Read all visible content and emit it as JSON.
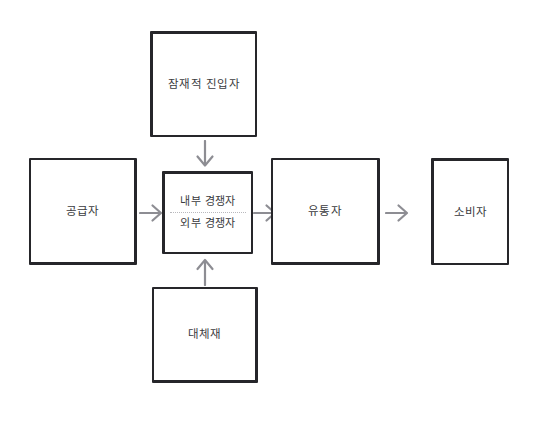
{
  "diagram": {
    "title": "",
    "background_color": "#ffffff",
    "box_border_color": "#26262a",
    "text_color": "#3b3b40",
    "arrow_color": "#8d8d93",
    "divider_color": "#b9b9bd",
    "nodes": [
      {
        "id": "potential-entrants",
        "label": "잠재적 진입자",
        "position": "top"
      },
      {
        "id": "supplier",
        "label": "공급자",
        "position": "left"
      },
      {
        "id": "competitors",
        "label_internal": "내부 경쟁자",
        "label_external": "외부 경쟁자",
        "position": "center"
      },
      {
        "id": "distributor",
        "label": "유통자",
        "position": "center-right"
      },
      {
        "id": "consumer",
        "label": "소비자",
        "position": "right"
      },
      {
        "id": "substitutes",
        "label": "대체재",
        "position": "bottom"
      }
    ],
    "arrows": [
      {
        "id": "entrants-to-competitors",
        "from": "potential-entrants",
        "to": "competitors",
        "direction": "down"
      },
      {
        "id": "supplier-to-competitors",
        "from": "supplier",
        "to": "competitors",
        "direction": "right"
      },
      {
        "id": "competitors-to-distributor",
        "from": "competitors",
        "to": "distributor",
        "direction": "right"
      },
      {
        "id": "distributor-to-consumer",
        "from": "distributor",
        "to": "consumer",
        "direction": "right"
      },
      {
        "id": "substitutes-to-competitors",
        "from": "substitutes",
        "to": "competitors",
        "direction": "up"
      }
    ]
  }
}
